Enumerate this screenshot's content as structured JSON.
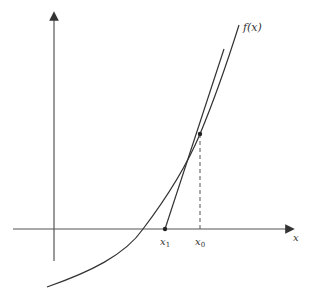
{
  "diagram": {
    "function_label": "f(x)",
    "x_axis_label": "x",
    "points": [
      {
        "name": "x1",
        "label_main": "x",
        "label_sub": "1"
      },
      {
        "name": "x0",
        "label_main": "x",
        "label_sub": "0"
      }
    ],
    "colors": {
      "axis": "#555555",
      "curve": "#333333",
      "tangent": "#333333",
      "dashed": "#555555",
      "background": "#ffffff"
    }
  }
}
